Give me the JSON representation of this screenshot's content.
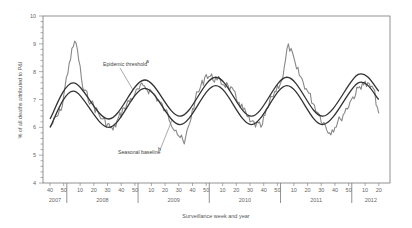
{
  "chart_data": {
    "type": "line",
    "title": "",
    "xlabel": "Surveillance week and year",
    "ylabel": "% of all deaths attributed to P&I",
    "ylim": [
      4,
      10
    ],
    "yticks": [
      4,
      5,
      6,
      7,
      8,
      9,
      10
    ],
    "grid": false,
    "legend": "none (inline annotations)",
    "x_week_ticks": [
      "40",
      "50",
      "10",
      "20",
      "30",
      "40",
      "50",
      "10",
      "20",
      "30",
      "40",
      "50",
      "10",
      "20",
      "30",
      "40",
      "50",
      "10",
      "20",
      "30",
      "40",
      "50",
      "10",
      "20"
    ],
    "x_year_labels": [
      "2007",
      "2008",
      "2009",
      "2010",
      "2011",
      "2012"
    ],
    "annotations": [
      {
        "text": "Epidemic threshold",
        "superscript": "a",
        "target": "epidemic-threshold"
      },
      {
        "text": "Seasonal baseline",
        "superscript": "b",
        "target": "seasonal-baseline"
      }
    ],
    "series": [
      {
        "name": "Epidemic threshold",
        "style": "smooth dark line",
        "x": [
          "2007-w40",
          "2008-w5",
          "2008-w31",
          "2009-w5",
          "2009-w31",
          "2010-w5",
          "2010-w31",
          "2011-w5",
          "2011-w31",
          "2012-w5",
          "2012-w20"
        ],
        "values": [
          6.3,
          7.6,
          6.3,
          7.7,
          6.4,
          7.8,
          6.4,
          7.8,
          6.4,
          7.9,
          7.3
        ]
      },
      {
        "name": "Seasonal baseline",
        "style": "smooth dark line",
        "x": [
          "2007-w40",
          "2008-w5",
          "2008-w31",
          "2009-w5",
          "2009-w31",
          "2010-w5",
          "2010-w31",
          "2011-w5",
          "2011-w31",
          "2012-w5",
          "2012-w20"
        ],
        "values": [
          6.0,
          7.3,
          6.0,
          7.4,
          6.1,
          7.5,
          6.1,
          7.5,
          6.1,
          7.6,
          7.0
        ]
      },
      {
        "name": "Observed % P&I deaths",
        "style": "jagged gray line",
        "x": [
          "2007-w40",
          "2007-w48",
          "2008-w2",
          "2008-w6",
          "2008-w8",
          "2008-w12",
          "2008-w18",
          "2008-w26",
          "2008-w34",
          "2008-w42",
          "2008-w50",
          "2009-w4",
          "2009-w12",
          "2009-w20",
          "2009-w28",
          "2009-w34",
          "2009-w42",
          "2009-w50",
          "2010-w6",
          "2010-w14",
          "2010-w22",
          "2010-w30",
          "2010-w38",
          "2010-w46",
          "2011-w2",
          "2011-w6",
          "2011-w12",
          "2011-w20",
          "2011-w28",
          "2011-w36",
          "2011-w44",
          "2011-w52",
          "2012-w8",
          "2012-w16",
          "2012-w20"
        ],
        "values": [
          6.0,
          6.6,
          8.3,
          9.1,
          8.8,
          7.4,
          6.9,
          6.3,
          5.9,
          6.7,
          7.2,
          7.5,
          7.2,
          6.6,
          5.9,
          5.4,
          7.0,
          7.9,
          7.7,
          7.5,
          6.9,
          6.2,
          6.0,
          7.1,
          7.8,
          9.0,
          8.1,
          7.3,
          6.5,
          5.8,
          6.3,
          7.0,
          7.6,
          7.4,
          6.5
        ]
      }
    ]
  }
}
